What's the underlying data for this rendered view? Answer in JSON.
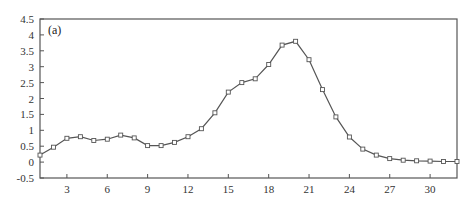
{
  "chart_data": {
    "type": "line",
    "title": "",
    "panel_label": "(a)",
    "xlabel": "",
    "ylabel": "",
    "xlim": [
      1,
      32
    ],
    "ylim": [
      -0.5,
      4.5
    ],
    "grid": false,
    "legend": null,
    "x_ticks": [
      3,
      6,
      9,
      12,
      15,
      18,
      21,
      24,
      27,
      30
    ],
    "y_ticks": [
      -0.5,
      0,
      0.5,
      1,
      1.5,
      2,
      2.5,
      3,
      3.5,
      4,
      4.5
    ],
    "y_tick_labels": [
      "-0.5",
      "0",
      "0.5",
      "1",
      "1.5",
      "2",
      "2.5",
      "3",
      "3.5",
      "4",
      "4.5"
    ],
    "marker": "open-square",
    "series": [
      {
        "name": "series",
        "color": "#555555",
        "x": [
          1,
          2,
          3,
          4,
          5,
          6,
          7,
          8,
          9,
          10,
          11,
          12,
          13,
          14,
          15,
          16,
          17,
          18,
          19,
          20,
          21,
          22,
          23,
          24,
          25,
          26,
          27,
          28,
          29,
          30,
          31,
          32
        ],
        "values": [
          0.22,
          0.47,
          0.75,
          0.8,
          0.68,
          0.72,
          0.85,
          0.76,
          0.52,
          0.52,
          0.62,
          0.8,
          1.05,
          1.55,
          2.2,
          2.5,
          2.62,
          3.07,
          3.68,
          3.8,
          3.22,
          2.28,
          1.42,
          0.79,
          0.41,
          0.22,
          0.11,
          0.06,
          0.04,
          0.03,
          0.02,
          0.02
        ]
      }
    ]
  },
  "colors": {
    "axis": "#555555",
    "line": "#555555",
    "marker_fill": "#ffffff",
    "background": "#ffffff"
  }
}
